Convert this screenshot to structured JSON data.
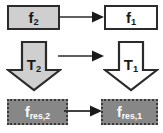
{
  "diagram": {
    "background_color": "#ffffff",
    "colors": {
      "light_gray_fill": "#cfcfcf",
      "white_fill": "#ffffff",
      "mid_gray_fill": "#878787",
      "border_dark": "#2b2b2b",
      "label_dark": "#1a1a1a",
      "label_light": "#ffffff"
    },
    "nodes": {
      "f2": {
        "base": "f",
        "sub": "2",
        "shape": "rectangle",
        "fill": "#cfcfcf"
      },
      "f1": {
        "base": "f",
        "sub": "1",
        "shape": "rectangle",
        "fill": "#ffffff"
      },
      "t2": {
        "base": "T",
        "sub": "2",
        "shape": "down-block-arrow",
        "fill": "#cfcfcf"
      },
      "t1": {
        "base": "T",
        "sub": "1",
        "shape": "down-block-arrow",
        "fill": "#ffffff"
      },
      "fres2": {
        "base": "f",
        "sub": "res,2",
        "shape": "dotted-rectangle",
        "fill": "#878787"
      },
      "fres1": {
        "base": "f",
        "sub": "res,1",
        "shape": "dotted-rectangle",
        "fill": "#878787"
      }
    },
    "connectors": [
      {
        "id": "arrow-top",
        "from": "f2",
        "to": "f1",
        "direction": "right"
      },
      {
        "id": "arrow-middle",
        "from": "t2",
        "to": "t1",
        "direction": "right"
      },
      {
        "id": "arrow-bottom",
        "from": "fres2",
        "to": "fres1",
        "direction": "right"
      }
    ]
  }
}
